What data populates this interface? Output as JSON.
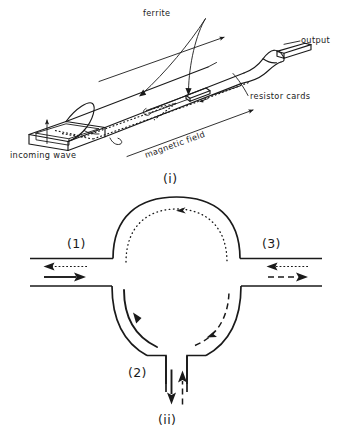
{
  "figure": {
    "title_present": false,
    "panels": [
      {
        "id": "i",
        "caption": "(i)",
        "type": "isometric-waveguide-isolator",
        "labels": {
          "ferrite": "ferrite",
          "output": "output",
          "resistor_cards": "resistor  cards",
          "incoming_wave": "incoming  wave",
          "magnetic_field": "magnetic  field"
        },
        "annotations": [
          {
            "name": "incoming-wave-arrow",
            "direction": "up"
          },
          {
            "name": "propagation-arrow-top",
            "direction": "right"
          },
          {
            "name": "magnetic-field-arrow",
            "direction": "right"
          },
          {
            "name": "ferrite-leader",
            "target": "ferrite slab inside guide"
          },
          {
            "name": "resistor-cards-leader",
            "target": "resistive vane cards"
          }
        ]
      },
      {
        "id": "ii",
        "caption": "(ii)",
        "type": "three-port-ring-circulator",
        "ports": [
          {
            "name": "port-1",
            "label": "(1)",
            "position": "left"
          },
          {
            "name": "port-2",
            "label": "(2)",
            "position": "bottom"
          },
          {
            "name": "port-3",
            "label": "(3)",
            "position": "right"
          }
        ],
        "flow_arrows": [
          {
            "name": "port-1-incident-solid",
            "style": "solid",
            "direction": "right"
          },
          {
            "name": "port-1-return-dotted",
            "style": "dotted",
            "direction": "left"
          },
          {
            "name": "port-3-incident-dotted",
            "style": "dotted",
            "direction": "left"
          },
          {
            "name": "port-3-return-dashed",
            "style": "dashed",
            "direction": "right"
          },
          {
            "name": "port-2-out-solid",
            "style": "solid",
            "direction": "down"
          },
          {
            "name": "port-2-in-dashed",
            "style": "dashed",
            "direction": "up"
          },
          {
            "name": "ring-top-dotted-arc",
            "style": "dotted",
            "direction": "counterclockwise"
          },
          {
            "name": "ring-lower-left-solid-arc",
            "style": "solid",
            "direction": "clockwise"
          },
          {
            "name": "ring-lower-right-dashed-arc",
            "style": "dashed",
            "direction": "clockwise"
          }
        ]
      }
    ]
  },
  "colors": {
    "ink": "#1a1a1a",
    "background": "#ffffff"
  }
}
